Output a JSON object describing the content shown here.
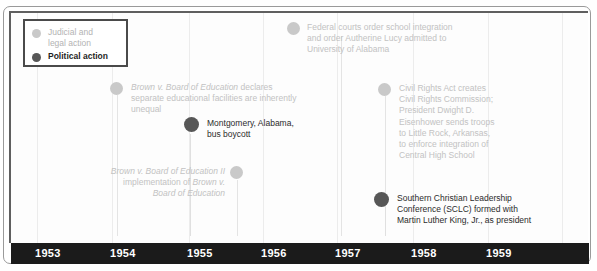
{
  "legend": {
    "items": [
      {
        "label": "Judicial and\nlegal action",
        "type": "judicial",
        "color": "#c9c9c9"
      },
      {
        "label": "Political action",
        "type": "political",
        "color": "#575757"
      }
    ]
  },
  "axis": {
    "years": [
      "1953",
      "1954",
      "1955",
      "1956",
      "1957",
      "1958",
      "1959"
    ],
    "bar_color": "#1b1b1b",
    "label_color": "#ffffff"
  },
  "events": [
    {
      "id": "brown-v-board",
      "type": "judicial",
      "year": "1954",
      "italic_lead": "Brown v. Board of Education",
      "text_rest": " declares\nseparate educational facilities are inherently\nunequal",
      "full_text": "Brown v. Board of Education declares separate educational facilities are inherently unequal"
    },
    {
      "id": "montgomery-bus-boycott",
      "type": "political",
      "year": "1955",
      "italic_lead": "",
      "text_rest": "Montgomery, Alabama,\nbus boycott",
      "full_text": "Montgomery, Alabama, bus boycott"
    },
    {
      "id": "brown-ii",
      "type": "judicial",
      "year": "1955",
      "italic_lead": "",
      "text_rest": "",
      "full_text": "Brown v. Board of Education II implementation of Brown v. Board of Education",
      "line1_italic": "Brown v. Board of Education II",
      "line2_plain": "implementation of ",
      "line2_italic": "Brown v.",
      "line3_italic": "Board of Education"
    },
    {
      "id": "federal-courts-integration",
      "type": "judicial",
      "year": "1956",
      "italic_lead": "",
      "text_rest": "Federal courts order school integration\nand order Autherine Lucy admitted to\nUniversity of Alabama",
      "full_text": "Federal courts order school integration and order Autherine Lucy admitted to University of Alabama"
    },
    {
      "id": "civil-rights-act-1957",
      "type": "judicial",
      "year": "1957",
      "italic_lead": "",
      "text_rest": "Civil Rights Act creates\nCivil Rights Commission;\nPresident Dwight D.\nEisenhower sends troops\nto Little Rock, Arkansas,\nto enforce integration of\nCentral High School",
      "full_text": "Civil Rights Act creates Civil Rights Commission; President Dwight D. Eisenhower sends troops to Little Rock, Arkansas, to enforce integration of Central High School"
    },
    {
      "id": "sclc-formed",
      "type": "political",
      "year": "1957",
      "italic_lead": "",
      "text_rest": "Southern Christian Leadership\nConference (SCLC) formed with\nMartin Luther King, Jr., as president",
      "full_text": "Southern Christian Leadership Conference (SCLC) formed with Martin Luther King, Jr., as president"
    }
  ]
}
